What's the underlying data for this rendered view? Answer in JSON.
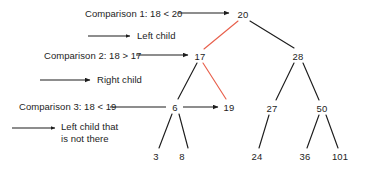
{
  "figure": {
    "kind": "binary-search-tree-lookup-diagram",
    "background_color": "#ffffff",
    "edge_color": "#1d1d1d",
    "highlight_color": "#e8604c",
    "text_color": "#1d1d1d"
  },
  "tree": {
    "nodes": [
      {
        "id": "n20",
        "label": "20",
        "x": 243,
        "y": 14,
        "level": 0
      },
      {
        "id": "n17",
        "label": "17",
        "x": 200,
        "y": 56,
        "level": 1
      },
      {
        "id": "n28",
        "label": "28",
        "x": 298,
        "y": 56,
        "level": 1
      },
      {
        "id": "n6",
        "label": "6",
        "x": 175,
        "y": 107,
        "level": 2
      },
      {
        "id": "n19",
        "label": "19",
        "x": 229,
        "y": 107,
        "level": 2
      },
      {
        "id": "n27",
        "label": "27",
        "x": 272,
        "y": 108,
        "level": 2
      },
      {
        "id": "n50",
        "label": "50",
        "x": 322,
        "y": 108,
        "level": 2
      },
      {
        "id": "n3",
        "label": "3",
        "x": 156,
        "y": 156,
        "level": 3
      },
      {
        "id": "n8",
        "label": "8",
        "x": 182,
        "y": 156,
        "level": 3
      },
      {
        "id": "n24",
        "label": "24",
        "x": 257,
        "y": 156,
        "level": 3
      },
      {
        "id": "n36",
        "label": "36",
        "x": 305,
        "y": 156,
        "level": 3
      },
      {
        "id": "n101",
        "label": "101",
        "x": 340,
        "y": 156,
        "level": 3
      }
    ],
    "edges": [
      {
        "from": "n20",
        "to": "n17",
        "highlighted": true
      },
      {
        "from": "n20",
        "to": "n28",
        "highlighted": false
      },
      {
        "from": "n17",
        "to": "n6",
        "highlighted": false
      },
      {
        "from": "n17",
        "to": "n19",
        "highlighted": true
      },
      {
        "from": "n28",
        "to": "n27",
        "highlighted": false
      },
      {
        "from": "n28",
        "to": "n50",
        "highlighted": false
      },
      {
        "from": "n6",
        "to": "n3",
        "highlighted": false
      },
      {
        "from": "n6",
        "to": "n8",
        "highlighted": false
      },
      {
        "from": "n27",
        "to": "n24",
        "highlighted": false
      },
      {
        "from": "n50",
        "to": "n36",
        "highlighted": false
      },
      {
        "from": "n50",
        "to": "n101",
        "highlighted": false
      }
    ]
  },
  "annotations": [
    {
      "id": "comparison-1",
      "text": "Comparison 1: 18 < 20",
      "x": 85,
      "y": 8,
      "connector": {
        "type": "arrow",
        "x1": 178,
        "y1": 13,
        "x2": 230,
        "y2": 13
      }
    },
    {
      "id": "left-child-1",
      "text": "Left child",
      "x": 137,
      "y": 32,
      "connector": {
        "type": "arrow",
        "x1": 88,
        "y1": 36,
        "x2": 131,
        "y2": 36
      }
    },
    {
      "id": "comparison-2",
      "text": "Comparison 2: 18 > 17",
      "x": 44,
      "y": 50,
      "connector": {
        "type": "arrow",
        "x1": 136,
        "y1": 55,
        "x2": 189,
        "y2": 55
      }
    },
    {
      "id": "right-child",
      "text": "Right child",
      "x": 97,
      "y": 76,
      "connector": {
        "type": "arrow",
        "x1": 40,
        "y1": 80,
        "x2": 91,
        "y2": 80
      }
    },
    {
      "id": "comparison-3",
      "text": "Comparison 3: 18 < 19",
      "x": 19,
      "y": 101,
      "connector": {
        "type": "line",
        "x1": 110,
        "y1": 107,
        "x2": 165,
        "y2": 107
      }
    },
    {
      "id": "six-to-nineteen-arrow",
      "text": "",
      "connector": {
        "type": "arrow",
        "x1": 183,
        "y1": 107,
        "x2": 219,
        "y2": 107
      }
    },
    {
      "id": "left-child-not-there",
      "text": "Left child that is not there",
      "line1": "Left child that",
      "line2": "is not there",
      "x": 60,
      "y": 121,
      "connector": {
        "type": "arrow",
        "x1": 12,
        "y1": 128,
        "x2": 56,
        "y2": 128
      }
    }
  ]
}
